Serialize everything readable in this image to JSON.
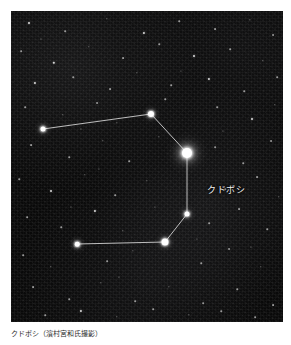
{
  "figure": {
    "caption": "クドボシ（濱村宮和氏撮影）",
    "photo": {
      "alt_name": "night-sky-constellation-photograph",
      "background_color": "#090909",
      "star_color": "#ffffff",
      "line_color": "#e6e6e6",
      "width": 272,
      "height": 311
    },
    "label": {
      "text": "クドボシ",
      "x": 196,
      "y": 172
    }
  },
  "chart_data": {
    "type": "scatter",
    "title": "クドボシ",
    "xlabel": "",
    "ylabel": "",
    "xlim": [
      0,
      272
    ],
    "ylim": [
      0,
      311
    ],
    "grid": false,
    "legend": "none",
    "annotations": [
      {
        "text": "クドボシ",
        "x": 185,
        "y": 161
      }
    ],
    "series": [
      {
        "name": "constellation-stars",
        "points": [
          {
            "id": "s1",
            "x": 32,
            "y": 118,
            "mag": 2.4,
            "size": 5.0
          },
          {
            "id": "s2",
            "x": 140,
            "y": 103,
            "mag": 2.0,
            "size": 6.0
          },
          {
            "id": "s3",
            "x": 176,
            "y": 142,
            "mag": 1.6,
            "size": 5.0
          },
          {
            "id": "s4",
            "x": 176,
            "y": 142,
            "mag": 0.4,
            "size": 10.0
          },
          {
            "id": "s5",
            "x": 176,
            "y": 203,
            "mag": 2.6,
            "size": 5.0
          },
          {
            "id": "s6",
            "x": 154,
            "y": 231,
            "mag": 1.8,
            "size": 7.0
          },
          {
            "id": "s7",
            "x": 66,
            "y": 233,
            "mag": 2.8,
            "size": 4.5
          }
        ]
      }
    ],
    "lines": [
      {
        "from": "s1",
        "to": "s2"
      },
      {
        "from": "s2",
        "to": "s4"
      },
      {
        "from": "s4",
        "to": "s5"
      },
      {
        "from": "s5",
        "to": "s6"
      },
      {
        "from": "s6",
        "to": "s7"
      }
    ],
    "field_stars": [
      {
        "x": 18,
        "y": 12,
        "size": 2.0
      },
      {
        "x": 54,
        "y": 20,
        "size": 1.6
      },
      {
        "x": 96,
        "y": 8,
        "size": 1.4
      },
      {
        "x": 133,
        "y": 22,
        "size": 2.2
      },
      {
        "x": 168,
        "y": 10,
        "size": 1.5
      },
      {
        "x": 204,
        "y": 18,
        "size": 1.8
      },
      {
        "x": 239,
        "y": 9,
        "size": 1.3
      },
      {
        "x": 262,
        "y": 24,
        "size": 1.9
      },
      {
        "x": 10,
        "y": 40,
        "size": 1.7
      },
      {
        "x": 43,
        "y": 52,
        "size": 2.4
      },
      {
        "x": 78,
        "y": 36,
        "size": 1.4
      },
      {
        "x": 112,
        "y": 47,
        "size": 1.8
      },
      {
        "x": 148,
        "y": 33,
        "size": 1.5
      },
      {
        "x": 183,
        "y": 45,
        "size": 2.0
      },
      {
        "x": 219,
        "y": 38,
        "size": 1.6
      },
      {
        "x": 252,
        "y": 50,
        "size": 1.4
      },
      {
        "x": 24,
        "y": 72,
        "size": 2.1
      },
      {
        "x": 62,
        "y": 66,
        "size": 1.5
      },
      {
        "x": 99,
        "y": 78,
        "size": 1.8
      },
      {
        "x": 126,
        "y": 62,
        "size": 1.3
      },
      {
        "x": 160,
        "y": 74,
        "size": 1.6
      },
      {
        "x": 198,
        "y": 68,
        "size": 2.2
      },
      {
        "x": 233,
        "y": 80,
        "size": 1.5
      },
      {
        "x": 266,
        "y": 66,
        "size": 1.7
      },
      {
        "x": 14,
        "y": 96,
        "size": 1.6
      },
      {
        "x": 52,
        "y": 104,
        "size": 1.4
      },
      {
        "x": 86,
        "y": 92,
        "size": 1.9
      },
      {
        "x": 106,
        "y": 112,
        "size": 1.3
      },
      {
        "x": 154,
        "y": 88,
        "size": 1.5
      },
      {
        "x": 206,
        "y": 96,
        "size": 1.7
      },
      {
        "x": 241,
        "y": 108,
        "size": 2.0
      },
      {
        "x": 264,
        "y": 94,
        "size": 1.4
      },
      {
        "x": 20,
        "y": 134,
        "size": 1.8
      },
      {
        "x": 58,
        "y": 146,
        "size": 1.5
      },
      {
        "x": 92,
        "y": 130,
        "size": 1.4
      },
      {
        "x": 118,
        "y": 150,
        "size": 1.6
      },
      {
        "x": 148,
        "y": 126,
        "size": 1.3
      },
      {
        "x": 204,
        "y": 136,
        "size": 1.7
      },
      {
        "x": 232,
        "y": 152,
        "size": 1.5
      },
      {
        "x": 260,
        "y": 130,
        "size": 1.9
      },
      {
        "x": 8,
        "y": 168,
        "size": 1.5
      },
      {
        "x": 40,
        "y": 180,
        "size": 2.0
      },
      {
        "x": 74,
        "y": 164,
        "size": 1.4
      },
      {
        "x": 104,
        "y": 184,
        "size": 1.6
      },
      {
        "x": 136,
        "y": 170,
        "size": 1.3
      },
      {
        "x": 214,
        "y": 178,
        "size": 1.5
      },
      {
        "x": 246,
        "y": 166,
        "size": 1.8
      },
      {
        "x": 268,
        "y": 186,
        "size": 1.4
      },
      {
        "x": 16,
        "y": 206,
        "size": 1.7
      },
      {
        "x": 50,
        "y": 216,
        "size": 1.5
      },
      {
        "x": 84,
        "y": 200,
        "size": 2.1
      },
      {
        "x": 112,
        "y": 220,
        "size": 1.4
      },
      {
        "x": 198,
        "y": 212,
        "size": 1.6
      },
      {
        "x": 228,
        "y": 198,
        "size": 1.8
      },
      {
        "x": 256,
        "y": 218,
        "size": 1.5
      },
      {
        "x": 12,
        "y": 244,
        "size": 1.6
      },
      {
        "x": 40,
        "y": 256,
        "size": 1.4
      },
      {
        "x": 96,
        "y": 250,
        "size": 1.7
      },
      {
        "x": 122,
        "y": 240,
        "size": 1.3
      },
      {
        "x": 190,
        "y": 252,
        "size": 1.5
      },
      {
        "x": 218,
        "y": 238,
        "size": 1.9
      },
      {
        "x": 250,
        "y": 256,
        "size": 1.4
      },
      {
        "x": 22,
        "y": 276,
        "size": 1.8
      },
      {
        "x": 58,
        "y": 288,
        "size": 1.5
      },
      {
        "x": 90,
        "y": 272,
        "size": 1.4
      },
      {
        "x": 124,
        "y": 290,
        "size": 1.6
      },
      {
        "x": 158,
        "y": 276,
        "size": 1.3
      },
      {
        "x": 192,
        "y": 292,
        "size": 1.7
      },
      {
        "x": 226,
        "y": 278,
        "size": 1.5
      },
      {
        "x": 262,
        "y": 294,
        "size": 1.8
      },
      {
        "x": 34,
        "y": 304,
        "size": 1.5
      },
      {
        "x": 70,
        "y": 300,
        "size": 2.2
      },
      {
        "x": 106,
        "y": 306,
        "size": 1.4
      },
      {
        "x": 142,
        "y": 298,
        "size": 1.6
      },
      {
        "x": 178,
        "y": 304,
        "size": 1.3
      },
      {
        "x": 210,
        "y": 300,
        "size": 1.5
      },
      {
        "x": 244,
        "y": 306,
        "size": 1.7
      },
      {
        "x": 30,
        "y": 28,
        "size": 1.2
      },
      {
        "x": 70,
        "y": 118,
        "size": 1.2
      },
      {
        "x": 170,
        "y": 60,
        "size": 1.2
      },
      {
        "x": 212,
        "y": 120,
        "size": 1.2
      },
      {
        "x": 88,
        "y": 158,
        "size": 1.2
      },
      {
        "x": 144,
        "y": 196,
        "size": 1.2
      },
      {
        "x": 240,
        "y": 236,
        "size": 1.2
      },
      {
        "x": 60,
        "y": 196,
        "size": 1.2
      },
      {
        "x": 186,
        "y": 228,
        "size": 1.2
      },
      {
        "x": 108,
        "y": 266,
        "size": 1.2
      }
    ]
  }
}
